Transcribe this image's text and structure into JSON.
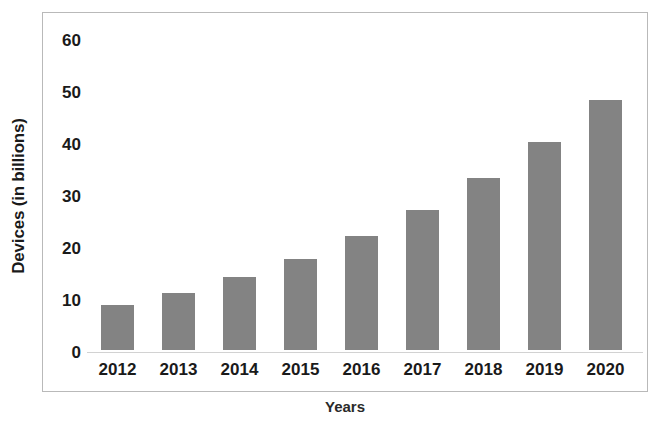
{
  "chart_data": {
    "type": "bar",
    "title": "",
    "subtitle": "",
    "xlabel": "Years",
    "ylabel": "Devices (in billions)",
    "categories": [
      "2012",
      "2013",
      "2014",
      "2015",
      "2016",
      "2017",
      "2018",
      "2019",
      "2020"
    ],
    "values": [
      8.7,
      11,
      14,
      17.5,
      22,
      27,
      33,
      40,
      48
    ],
    "series": [
      {
        "name": "Devices",
        "values": [
          8.7,
          11,
          14,
          17.5,
          22,
          27,
          33,
          40,
          48
        ]
      }
    ],
    "ylim": [
      0,
      60
    ],
    "ytick_labels": [
      "0",
      "10",
      "20",
      "30",
      "40",
      "50",
      "60"
    ],
    "ytick_values": [
      0,
      10,
      20,
      30,
      40,
      50,
      60
    ],
    "grid": false,
    "legend": false,
    "legend_position": "none",
    "bar_color": "#838383",
    "frame_color": "#b9b9b9",
    "text_color": "#1a1a1a",
    "background_color": "#ffffff"
  }
}
